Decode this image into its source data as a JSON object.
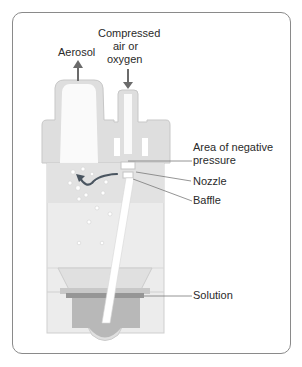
{
  "diagram": {
    "labels": {
      "aerosol": "Aerosol",
      "compressed_line1": "Compressed",
      "compressed_line2": "air or",
      "compressed_line3": "oxygen",
      "negative_pressure_line1": "Area of negative",
      "negative_pressure_line2": "pressure",
      "nozzle": "Nozzle",
      "baffle": "Baffle",
      "solution": "Solution"
    },
    "colors": {
      "body": "#e6e6e6",
      "cap": "#dcdcdc",
      "solution": "#a9a9a9",
      "solution_band": "#8f8f8f",
      "arrow": "#6b6b6b",
      "leader": "#7a7a7a",
      "frame": "#8a8a8a",
      "flow_arrow": "#4a5560"
    }
  }
}
